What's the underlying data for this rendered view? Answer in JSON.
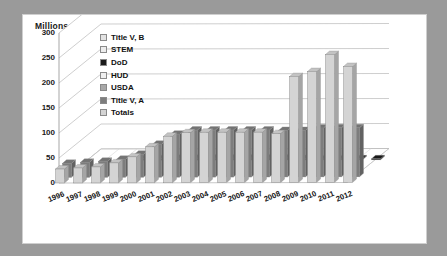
{
  "frame": {
    "border_color": "#9a9a9a",
    "plot_background": "#ffffff"
  },
  "chart_data": {
    "type": "bar",
    "subtype": "3d-column",
    "title": "",
    "subtitle": "",
    "xlabel": "",
    "ylabel": "Millions",
    "ylim": [
      0,
      300
    ],
    "yticks": [
      300,
      250,
      200,
      150,
      100,
      50,
      0
    ],
    "ytick_labels": [
      "300",
      "250",
      "200",
      "150",
      "100",
      "50",
      "0"
    ],
    "grid": true,
    "legend_position": "inside-upper-left",
    "categories": [
      "1996",
      "1997",
      "1998",
      "1999",
      "2000",
      "2001",
      "2002",
      "2003",
      "2004",
      "2005",
      "2006",
      "2007",
      "2008",
      "2009",
      "2010",
      "2011",
      "2012"
    ],
    "series": [
      {
        "name": "Title V, B",
        "color": "#e2e2e2",
        "values": [
          0,
          0,
          0,
          0,
          0,
          0,
          0,
          0,
          0,
          0,
          0,
          0,
          0,
          0,
          0,
          0,
          0
        ]
      },
      {
        "name": "STEM",
        "color": "#ededed",
        "values": [
          0,
          0,
          0,
          0,
          0,
          0,
          0,
          0,
          0,
          0,
          0,
          0,
          0,
          0,
          0,
          0,
          0
        ]
      },
      {
        "name": "DoD",
        "color": "#1b1b1b",
        "values": [
          0,
          0,
          0,
          3,
          3,
          4,
          4,
          4,
          4,
          4,
          4,
          4,
          3,
          2,
          2,
          2,
          2
        ]
      },
      {
        "name": "HUD",
        "color": "#efefef",
        "values": [
          0,
          0,
          0,
          0,
          0,
          0,
          0,
          0,
          0,
          0,
          0,
          0,
          0,
          0,
          0,
          0,
          0
        ]
      },
      {
        "name": "USDA",
        "color": "#a8a8a8",
        "values": [
          0,
          0,
          0,
          0,
          0,
          0,
          0,
          0,
          0,
          0,
          0,
          0,
          0,
          0,
          0,
          0,
          0
        ]
      },
      {
        "name": "Title V, A",
        "color": "#7d7d7d",
        "values": [
          28,
          30,
          32,
          36,
          46,
          66,
          86,
          94,
          94,
          94,
          94,
          94,
          93,
          93,
          98,
          98,
          98
        ]
      },
      {
        "name": "Totals",
        "color": "#d4d4d4",
        "values": [
          28,
          30,
          32,
          40,
          52,
          72,
          93,
          100,
          101,
          101,
          101,
          101,
          98,
          212,
          222,
          256,
          232
        ]
      }
    ]
  },
  "legend": {
    "items": [
      {
        "label": "Title V, B",
        "color": "#e2e2e2"
      },
      {
        "label": "STEM",
        "color": "#ededed"
      },
      {
        "label": "DoD",
        "color": "#1b1b1b"
      },
      {
        "label": "HUD",
        "color": "#efefef"
      },
      {
        "label": "USDA",
        "color": "#a8a8a8"
      },
      {
        "label": "Title V, A",
        "color": "#7d7d7d"
      },
      {
        "label": "Totals",
        "color": "#d4d4d4"
      }
    ]
  }
}
